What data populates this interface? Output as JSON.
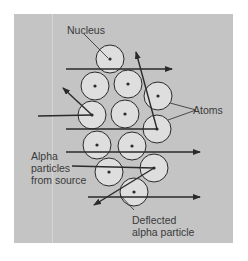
{
  "labels": {
    "nucleus": "Nucleus",
    "atoms": "Atoms",
    "alpha_line1": "Alpha",
    "alpha_line2": "particles",
    "alpha_line3": "from source",
    "deflected_line1": "Deflected",
    "deflected_line2": "alpha particle"
  },
  "colors": {
    "panel": "#c4c4c4",
    "atom_fill": "#dedede",
    "stroke": "#2a2a2a"
  },
  "atoms": [
    {
      "cx": 110,
      "cy": 59
    },
    {
      "cx": 95,
      "cy": 86
    },
    {
      "cx": 128,
      "cy": 84
    },
    {
      "cx": 158,
      "cy": 96
    },
    {
      "cx": 92,
      "cy": 115
    },
    {
      "cx": 125,
      "cy": 114
    },
    {
      "cx": 157,
      "cy": 129
    },
    {
      "cx": 97,
      "cy": 145
    },
    {
      "cx": 132,
      "cy": 146
    },
    {
      "cx": 109,
      "cy": 172
    },
    {
      "cx": 154,
      "cy": 168
    },
    {
      "cx": 134,
      "cy": 192
    }
  ],
  "atom_radius": 14
}
